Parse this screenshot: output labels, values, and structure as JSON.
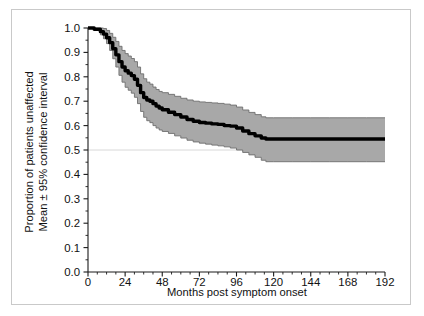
{
  "figure": {
    "background": "#ffffff",
    "frame_color": "#c9c9c9",
    "band_color": "#a8a8a8",
    "band_edge_color": "#6e6e6e",
    "line_color": "#000000",
    "axis_color": "#1a1a1a",
    "gridline_color": "#d8d8d8"
  },
  "chart_data": {
    "type": "line",
    "title": "",
    "subtitle": "",
    "xlabel": "Months post symptom onset",
    "ylabel_line1": "Proportion of patients unaffected",
    "ylabel_line2": "Mean ± 95% confidence interval",
    "ylabel": "Proportion of patients unaffected Mean ± 95% confidence interval",
    "xlim": [
      0,
      192
    ],
    "ylim": [
      0.0,
      1.0
    ],
    "xticks": [
      0,
      24,
      48,
      72,
      96,
      120,
      144,
      168,
      192
    ],
    "xtick_labels": [
      "0",
      "24",
      "48",
      "72",
      "96",
      "120",
      "144",
      "168",
      "192"
    ],
    "yticks": [
      0.0,
      0.1,
      0.2,
      0.3,
      0.4,
      0.5,
      0.6,
      0.7,
      0.8,
      0.9,
      1.0
    ],
    "ytick_labels": [
      "0.0",
      "0.1",
      "0.2",
      "0.3",
      "0.4",
      "0.5",
      "0.6",
      "0.7",
      "0.8",
      "0.9",
      "1.0"
    ],
    "x_minor_ticks": true,
    "y_minor_ticks": true,
    "grid": false,
    "gridlines_y": [
      0.5
    ],
    "legend": null,
    "legend_position": "none",
    "annotations": [],
    "series": [
      {
        "name": "Mean proportion unaffected",
        "style": "step-line",
        "x": [
          0,
          4,
          8,
          10,
          12,
          14,
          16,
          18,
          20,
          22,
          24,
          26,
          28,
          30,
          32,
          34,
          36,
          38,
          40,
          42,
          44,
          46,
          48,
          52,
          56,
          60,
          64,
          68,
          72,
          76,
          80,
          84,
          88,
          92,
          96,
          100,
          104,
          108,
          112,
          115,
          120,
          132,
          144,
          156,
          168,
          180,
          192
        ],
        "values": [
          1.0,
          0.995,
          0.985,
          0.975,
          0.96,
          0.94,
          0.915,
          0.89,
          0.862,
          0.84,
          0.825,
          0.815,
          0.805,
          0.79,
          0.765,
          0.735,
          0.715,
          0.705,
          0.7,
          0.69,
          0.68,
          0.672,
          0.665,
          0.655,
          0.645,
          0.635,
          0.625,
          0.618,
          0.613,
          0.61,
          0.607,
          0.605,
          0.6,
          0.598,
          0.59,
          0.578,
          0.567,
          0.558,
          0.549,
          0.545,
          0.545,
          0.545,
          0.545,
          0.545,
          0.545,
          0.545,
          0.545
        ]
      },
      {
        "name": "Upper 95% confidence limit",
        "style": "band-edge",
        "x": [
          0,
          4,
          8,
          10,
          12,
          14,
          16,
          18,
          20,
          22,
          24,
          26,
          28,
          30,
          32,
          34,
          36,
          38,
          40,
          42,
          44,
          46,
          48,
          52,
          56,
          60,
          64,
          68,
          72,
          76,
          80,
          84,
          88,
          92,
          96,
          100,
          104,
          108,
          112,
          115,
          120,
          132,
          144,
          156,
          168,
          180,
          192
        ],
        "values": [
          1.0,
          1.0,
          1.0,
          0.998,
          0.99,
          0.978,
          0.962,
          0.945,
          0.925,
          0.908,
          0.895,
          0.885,
          0.875,
          0.862,
          0.84,
          0.812,
          0.792,
          0.778,
          0.77,
          0.758,
          0.748,
          0.74,
          0.735,
          0.728,
          0.72,
          0.712,
          0.705,
          0.7,
          0.697,
          0.695,
          0.693,
          0.691,
          0.688,
          0.684,
          0.676,
          0.664,
          0.654,
          0.645,
          0.636,
          0.632,
          0.632,
          0.632,
          0.632,
          0.632,
          0.632,
          0.632,
          0.632
        ]
      },
      {
        "name": "Lower 95% confidence limit",
        "style": "band-edge",
        "x": [
          0,
          4,
          8,
          10,
          12,
          14,
          16,
          18,
          20,
          22,
          24,
          26,
          28,
          30,
          32,
          34,
          36,
          38,
          40,
          42,
          44,
          46,
          48,
          52,
          56,
          60,
          64,
          68,
          72,
          76,
          80,
          84,
          88,
          92,
          96,
          100,
          104,
          108,
          112,
          115,
          120,
          132,
          144,
          156,
          168,
          180,
          192
        ],
        "values": [
          1.0,
          0.99,
          0.972,
          0.956,
          0.936,
          0.908,
          0.874,
          0.84,
          0.806,
          0.778,
          0.757,
          0.745,
          0.733,
          0.716,
          0.69,
          0.658,
          0.634,
          0.62,
          0.612,
          0.6,
          0.59,
          0.582,
          0.576,
          0.568,
          0.558,
          0.549,
          0.54,
          0.533,
          0.528,
          0.524,
          0.52,
          0.517,
          0.513,
          0.508,
          0.5,
          0.49,
          0.48,
          0.47,
          0.458,
          0.452,
          0.452,
          0.452,
          0.452,
          0.452,
          0.452,
          0.452,
          0.452
        ]
      }
    ]
  },
  "plot_geometry": {
    "left_px": 88,
    "right_px": 385,
    "top_px": 28,
    "bottom_px": 272
  }
}
